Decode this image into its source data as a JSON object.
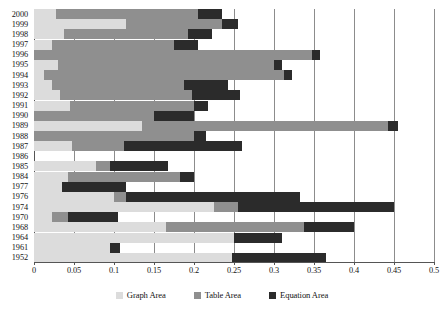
{
  "chart_data": {
    "type": "bar",
    "orientation": "horizontal",
    "stacked": true,
    "title": "",
    "subtitle": "",
    "xlabel": "",
    "ylabel": "",
    "xlim": [
      0,
      0.5
    ],
    "xticks": [
      "0",
      "0.05",
      "0.1",
      "0.15",
      "0.2",
      "0.25",
      "0.3",
      "0.35",
      "0.4",
      "0.45",
      "0.5"
    ],
    "xtick_values": [
      0,
      0.05,
      0.1,
      0.15,
      0.2,
      0.25,
      0.3,
      0.35,
      0.4,
      0.45,
      0.5
    ],
    "grid": "vertical",
    "legend_position": "bottom-center",
    "categories": [
      "2000",
      "1999",
      "1998",
      "1997",
      "1996",
      "1995",
      "1994",
      "1993",
      "1992",
      "1991",
      "1990",
      "1989",
      "1988",
      "1987",
      "1986",
      "1985",
      "1984",
      "1977",
      "1976",
      "1974",
      "1970",
      "1968",
      "1964",
      "1961",
      "1952"
    ],
    "series": [
      {
        "name": "Graph Area",
        "color": "#dcdcdc",
        "values": [
          0.027,
          0.115,
          0.037,
          0.022,
          0.0,
          0.03,
          0.012,
          0.022,
          0.032,
          0.045,
          0.0,
          0.135,
          0.0,
          0.047,
          0.0,
          0.078,
          0.042,
          0.035,
          0.1,
          0.225,
          0.023,
          0.165,
          0.25,
          0.095,
          0.248
        ]
      },
      {
        "name": "Table Area",
        "color": "#8f8f8f",
        "values": [
          0.178,
          0.12,
          0.156,
          0.153,
          0.348,
          0.27,
          0.301,
          0.165,
          0.166,
          0.155,
          0.15,
          0.308,
          0.2,
          0.066,
          0.0,
          0.017,
          0.14,
          0.0,
          0.015,
          0.03,
          0.02,
          0.173,
          0.0,
          0.0,
          0.0
        ]
      },
      {
        "name": "Equation Area",
        "color": "#2b2b2b",
        "values": [
          0.03,
          0.02,
          0.029,
          0.03,
          0.01,
          0.01,
          0.009,
          0.056,
          0.06,
          0.018,
          0.05,
          0.012,
          0.015,
          0.147,
          0.0,
          0.072,
          0.018,
          0.08,
          0.217,
          0.195,
          0.062,
          0.062,
          0.06,
          0.013,
          0.117
        ]
      }
    ],
    "totals": [
      0.235,
      0.255,
      0.222,
      0.205,
      0.358,
      0.31,
      0.322,
      0.243,
      0.258,
      0.218,
      0.2,
      0.455,
      0.215,
      0.26,
      0.0,
      0.167,
      0.2,
      0.115,
      0.332,
      0.45,
      0.105,
      0.4,
      0.31,
      0.108,
      0.365
    ]
  },
  "legend": {
    "items": [
      {
        "label": "Graph Area",
        "color": "#dcdcdc",
        "icon": "square-swatch-icon"
      },
      {
        "label": "Table Area",
        "color": "#8f8f8f",
        "icon": "square-swatch-icon"
      },
      {
        "label": "Equation Area",
        "color": "#2b2b2b",
        "icon": "square-swatch-icon"
      }
    ]
  },
  "colors": {
    "graph_area": "#dcdcdc",
    "table_area": "#8f8f8f",
    "equation_area": "#2b2b2b",
    "axis": "#555555",
    "gridline": "#8c8c8c",
    "background": "#ffffff",
    "text": "#141414"
  }
}
